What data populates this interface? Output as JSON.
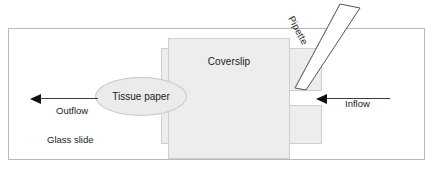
{
  "figure": {
    "type": "schematic-diagram"
  },
  "labels": {
    "coverslip": "Coverslip",
    "tissue_paper": "Tissue paper",
    "pipette": "Pipette",
    "outflow": "Outflow",
    "inflow": "Inflow",
    "glass_slide": "Glass slide"
  },
  "icons": {
    "outflow_arrow": "arrow-left-icon",
    "inflow_arrow": "arrow-left-icon",
    "pipette_shape": "pipette-icon"
  },
  "colors": {
    "background": "#ffffff",
    "slide_border": "#b9b9b9",
    "coverslip_fill": "#ededed",
    "coverslip_border": "#cfcfcf",
    "tissue_fill": "#ebebeb",
    "tissue_border": "#c8c8c8",
    "arrow": "#111111",
    "text": "#1a1a1a"
  }
}
